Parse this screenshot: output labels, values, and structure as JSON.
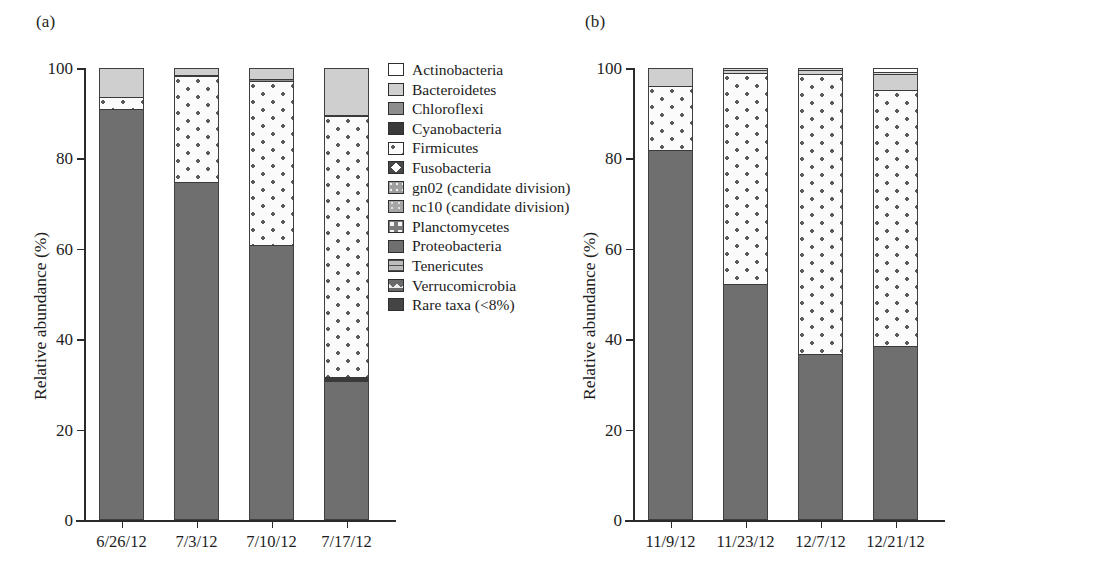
{
  "figure": {
    "panel_a_label": "(a)",
    "panel_b_label": "(b)"
  },
  "chart_data": [
    {
      "type": "bar",
      "panel": "(a)",
      "stacked": true,
      "title": "",
      "xlabel": "",
      "ylabel": "Relative abundance (%)",
      "ylim": [
        0,
        100
      ],
      "yticks": [
        0,
        20,
        40,
        60,
        80,
        100
      ],
      "ytick_labels": [
        "0",
        "20",
        "40",
        "60",
        "80",
        "100"
      ],
      "grid": false,
      "legend_position": "right",
      "categories": [
        "6/26/12",
        "7/3/12",
        "7/10/12",
        "7/17/12"
      ],
      "series": [
        {
          "name": "Proteobacteria",
          "fill": "f-proteo",
          "values": [
            91.0,
            74.8,
            60.8,
            30.8
          ]
        },
        {
          "name": "Cyanobacteria",
          "fill": "f-cyano",
          "values": [
            0.0,
            0.0,
            0.0,
            0.9
          ]
        },
        {
          "name": "Firmicutes",
          "fill": "f-firmicutes",
          "values": [
            2.6,
            23.4,
            36.4,
            57.6
          ]
        },
        {
          "name": "Chloroflexi",
          "fill": "f-chloro",
          "values": [
            0.0,
            0.3,
            0.3,
            0.3
          ]
        },
        {
          "name": "Bacteroidetes",
          "fill": "f-bacteroid",
          "values": [
            6.4,
            1.5,
            2.5,
            10.4
          ]
        }
      ],
      "legend": [
        {
          "label": "Actinobacteria",
          "fill": "f-white"
        },
        {
          "label": "Bacteroidetes",
          "fill": "f-bacteroid"
        },
        {
          "label": "Chloroflexi",
          "fill": "f-chloro"
        },
        {
          "label": "Cyanobacteria",
          "fill": "f-cyano"
        },
        {
          "label": "Firmicutes",
          "fill": "f-firmicutes"
        },
        {
          "label": "Fusobacteria",
          "fill": "f-fuso"
        },
        {
          "label": "gn02 (candidate division)",
          "fill": "f-gn02"
        },
        {
          "label": "nc10 (candidate division)",
          "fill": "f-nc10"
        },
        {
          "label": "Planctomycetes",
          "fill": "f-plancto"
        },
        {
          "label": "Proteobacteria",
          "fill": "f-proteo"
        },
        {
          "label": "Tenericutes",
          "fill": "f-teneri"
        },
        {
          "label": "Verrucomicrobia",
          "fill": "f-verruco"
        },
        {
          "label": "Rare taxa (<8%)",
          "fill": "f-rare"
        }
      ]
    },
    {
      "type": "bar",
      "panel": "(b)",
      "stacked": true,
      "title": "",
      "xlabel": "",
      "ylabel": "Relative abundance (%)",
      "ylim": [
        0,
        100
      ],
      "yticks": [
        0,
        20,
        40,
        60,
        80,
        100
      ],
      "ytick_labels": [
        "0",
        "20",
        "40",
        "60",
        "80",
        "100"
      ],
      "grid": false,
      "legend_position": "right",
      "categories": [
        "11/9/12",
        "11/23/12",
        "12/7/12",
        "12/21/12"
      ],
      "series": [
        {
          "name": "Proteobacteria",
          "fill": "f-proteo",
          "values": [
            81.8,
            52.2,
            36.8,
            38.5
          ]
        },
        {
          "name": "Firmicutes",
          "fill": "f-firmicutes",
          "values": [
            14.2,
            46.8,
            61.9,
            56.7
          ]
        },
        {
          "name": "Bacteroidetes",
          "fill": "f-bacteroid",
          "values": [
            4.0,
            0.6,
            0.8,
            3.5
          ]
        },
        {
          "name": "Acidobacteria",
          "fill": "f-acido",
          "values": [
            0.0,
            0.4,
            0.5,
            0.5
          ]
        },
        {
          "name": "Actinobacteria",
          "fill": "f-white",
          "values": [
            0.0,
            0.0,
            0.0,
            0.8
          ]
        }
      ],
      "legend": [
        {
          "label": "Acidobacteria",
          "fill": "f-acido"
        },
        {
          "label": "Actinobacteria",
          "fill": "f-white"
        },
        {
          "label": "Bacteroidetes",
          "fill": "f-bacteroid"
        },
        {
          "label": "Chloroflexi",
          "fill": "f-chloro"
        },
        {
          "label": "Fibrobacteres",
          "fill": "f-fibro"
        },
        {
          "label": "Firmicutes",
          "fill": "f-fuso"
        },
        {
          "label": "Fusobacteria",
          "fill": "f-plancto"
        },
        {
          "label": "Planctomycetes",
          "fill": "f-verruco"
        },
        {
          "label": "Proteobacteria",
          "fill": "f-proteo"
        },
        {
          "label": "Spirochaetes",
          "fill": "f-spiro"
        },
        {
          "label": "tm6 (candidate division)",
          "fill": "f-tm6"
        },
        {
          "label": "tm7 (candidate division)",
          "fill": "f-tm7"
        },
        {
          "label": "Verrucomicrobia",
          "fill": "f-verruco"
        }
      ]
    }
  ]
}
